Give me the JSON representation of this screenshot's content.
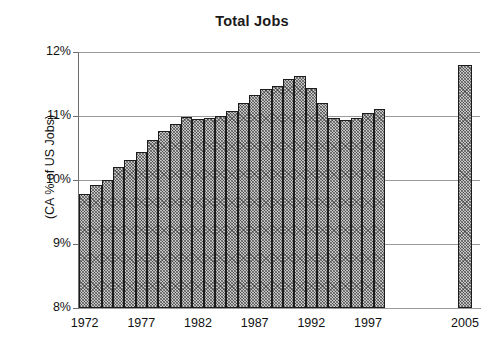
{
  "chart_data": {
    "type": "bar",
    "title": "Total Jobs",
    "xlabel": "",
    "ylabel": "(CA % of US Jobs)",
    "ylim": [
      8,
      12
    ],
    "ytick_labels": [
      "12%",
      "11%",
      "10%",
      "9%",
      "8%"
    ],
    "ytick_values": [
      12,
      11,
      10,
      9,
      8
    ],
    "grid": true,
    "legend": null,
    "xtick_labels": [
      "1972",
      "1977",
      "1982",
      "1987",
      "1992",
      "1997",
      "2005"
    ],
    "xtick_values": [
      1972,
      1977,
      1982,
      1987,
      1992,
      1997,
      2005
    ],
    "categories": [
      "1972",
      "1973",
      "1974",
      "1975",
      "1976",
      "1977",
      "1978",
      "1979",
      "1980",
      "1981",
      "1982",
      "1983",
      "1984",
      "1985",
      "1986",
      "1987",
      "1988",
      "1989",
      "1990",
      "1991",
      "1992",
      "1993",
      "1994",
      "1995",
      "1996",
      "1997",
      "1998",
      "2005"
    ],
    "values": [
      9.78,
      9.92,
      10.0,
      10.21,
      10.32,
      10.43,
      10.62,
      10.77,
      10.88,
      10.98,
      10.95,
      10.97,
      11.0,
      11.08,
      11.2,
      11.33,
      11.42,
      11.47,
      11.58,
      11.62,
      11.44,
      11.2,
      10.97,
      10.93,
      10.97,
      11.05,
      11.11,
      11.8
    ],
    "series": [
      {
        "name": "CA % of US Jobs",
        "values": [
          9.78,
          9.92,
          10.0,
          10.21,
          10.32,
          10.43,
          10.62,
          10.77,
          10.88,
          10.98,
          10.95,
          10.97,
          11.0,
          11.08,
          11.2,
          11.33,
          11.42,
          11.47,
          11.58,
          11.62,
          11.44,
          11.2,
          10.97,
          10.93,
          10.97,
          11.05,
          11.11,
          11.8
        ]
      }
    ],
    "bar_fill": "#c6c6c6",
    "bar_edge": "#1c1c1c",
    "gridline_color": "#9a9a9a",
    "background": "#ffffff",
    "note_gap": "Gap between 1998 and 2005 (projection)"
  }
}
